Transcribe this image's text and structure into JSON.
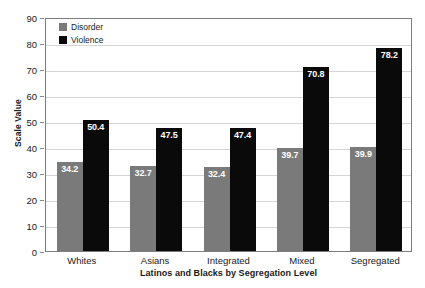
{
  "chart_data": {
    "type": "bar",
    "title": "",
    "xlabel": "Latinos and Blacks by Segregation Level",
    "ylabel": "Scale Value",
    "categories": [
      "Whites",
      "Asians",
      "Integrated",
      "Mixed",
      "Segregated"
    ],
    "series": [
      {
        "name": "Disorder",
        "color": "#7a7a7a",
        "values": [
          34.2,
          32.7,
          32.4,
          39.7,
          39.9
        ],
        "labels": [
          "34.2",
          "32.7",
          "32.4",
          "39.7",
          "39.9"
        ]
      },
      {
        "name": "Violence",
        "color": "#0a0a0a",
        "values": [
          50.4,
          47.5,
          47.4,
          70.8,
          78.2
        ],
        "labels": [
          "50.4",
          "47.5",
          "47.4",
          "70.8",
          "78.2"
        ]
      }
    ],
    "ylim": [
      0,
      90
    ],
    "ytick_values": [
      0,
      10,
      20,
      30,
      40,
      50,
      60,
      70,
      80,
      90
    ],
    "ytick_labels": [
      "0",
      "10",
      "20",
      "30",
      "40",
      "50",
      "60",
      "70",
      "80",
      "90"
    ],
    "grid": true,
    "legend_position": "top-left",
    "legend_entries": [
      "Disorder",
      "Violence"
    ],
    "colors": {
      "disorder": "#7a7a7a",
      "violence": "#0a0a0a",
      "gridline": "#d4d4d4",
      "axis": "#7d7d7d",
      "text": "#1a1a1a",
      "value_label": "#ffffff",
      "background": "#ffffff"
    }
  }
}
